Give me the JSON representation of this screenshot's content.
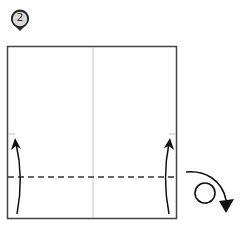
{
  "diagram": {
    "type": "origami-instruction-step",
    "step_marker": {
      "number": "2",
      "fill": "#d8d8d8",
      "stroke": "#222222"
    },
    "paper": {
      "fill": "#ffffff",
      "stroke": "#444444"
    },
    "crease_center": {
      "style": "thin-gray",
      "color": "#bbbbbb"
    },
    "fold_line": {
      "style": "dashed",
      "color": "#333333"
    },
    "arrows": [
      {
        "name": "fold-up-left",
        "direction": "up"
      },
      {
        "name": "fold-up-right",
        "direction": "up"
      },
      {
        "name": "turn-over",
        "meaning": "turn the model over"
      }
    ]
  }
}
